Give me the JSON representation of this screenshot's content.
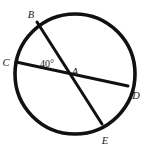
{
  "figure": {
    "type": "circle-with-two-intersecting-chords",
    "background_color": "#ffffff",
    "stroke_color": "#111111",
    "label_color": "#1a1a1a",
    "circle": {
      "center_x": 75,
      "center_y": 74,
      "radius": 60,
      "stroke_width": 3.6
    },
    "points": {
      "A": {
        "label": "A",
        "x": 68,
        "y": 72,
        "label_x": 73,
        "label_y": 71,
        "role": "chord-intersection"
      },
      "B": {
        "label": "B",
        "x": 37,
        "y": 22,
        "label_x": 29,
        "label_y": 14,
        "role": "on-circle"
      },
      "C": {
        "label": "C",
        "x": 16,
        "y": 62,
        "label_x": 4,
        "label_y": 62,
        "role": "on-circle"
      },
      "D": {
        "label": "D",
        "x": 128,
        "y": 86,
        "label_x": 134,
        "label_y": 95,
        "role": "on-circle"
      },
      "E": {
        "label": "E",
        "x": 102,
        "y": 124,
        "label_x": 103,
        "label_y": 140,
        "role": "on-circle"
      }
    },
    "chords": [
      {
        "name": "chord-BE",
        "from": "B",
        "to": "E",
        "x1": 37,
        "y1": 22,
        "x2": 102,
        "y2": 124
      },
      {
        "name": "chord-CD",
        "from": "C",
        "to": "D",
        "x1": 16,
        "y1": 62,
        "x2": 128,
        "y2": 86
      }
    ],
    "angles": [
      {
        "name": "angle-BAC",
        "value": "40°",
        "label_x": 41,
        "label_y": 65,
        "between": [
          "AB",
          "AC"
        ]
      }
    ]
  }
}
